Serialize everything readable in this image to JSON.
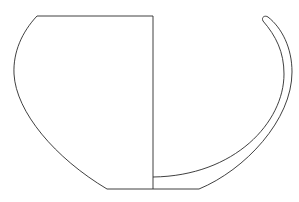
{
  "figure": {
    "type": "pottery-profile-drawing",
    "colors": {
      "line": "#2a2a2a",
      "background": "#ffffff"
    },
    "geometry": {
      "rim_y": 16,
      "base_y": 189,
      "axis_x": 153,
      "left_rim_x": 37,
      "left_base_x": 107,
      "right_base_x": 199,
      "rim_tip": [
        264,
        18
      ]
    }
  }
}
